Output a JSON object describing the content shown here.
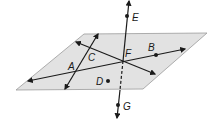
{
  "diagram": {
    "colors": {
      "plane_fill": "#e2e2e2",
      "plane_stroke": "#9a9a9a",
      "line": "#1a1a1a"
    },
    "plane": {
      "points": "84,34 207,33 143,89 16,90"
    },
    "points": [
      {
        "id": "A",
        "label": "A",
        "x": 77,
        "y": 71,
        "lx": 68,
        "ly": 70,
        "dot": false
      },
      {
        "id": "B",
        "label": "B",
        "x": 156,
        "y": 55,
        "lx": 148,
        "ly": 51,
        "dot": true
      },
      {
        "id": "C",
        "label": "C",
        "x": 88,
        "y": 50,
        "lx": 88,
        "ly": 61,
        "dot": false
      },
      {
        "id": "D",
        "label": "D",
        "x": 108,
        "y": 81,
        "lx": 96,
        "ly": 85,
        "dot": true
      },
      {
        "id": "E",
        "label": "E",
        "x": 127,
        "y": 16,
        "lx": 132,
        "ly": 21,
        "dot": true
      },
      {
        "id": "F",
        "label": "F",
        "x": 123,
        "y": 61,
        "lx": 125,
        "ly": 57,
        "dot": false
      },
      {
        "id": "G",
        "label": "G",
        "x": 118,
        "y": 105,
        "lx": 123,
        "ly": 110,
        "dot": true
      }
    ],
    "lines": [
      {
        "id": "line-AB",
        "x1": 28,
        "y1": 81,
        "x2": 185,
        "y2": 49
      },
      {
        "id": "line-through-A-C",
        "x1": 98,
        "y1": 34,
        "x2": 65,
        "y2": 89
      },
      {
        "id": "line-CF",
        "x1": 76,
        "y1": 42,
        "x2": 155,
        "y2": 74
      },
      {
        "id": "line-EF",
        "x1": 129,
        "y1": 1,
        "x2": 123,
        "y2": 61
      },
      {
        "id": "line-FG-dashed",
        "x1": 123,
        "y1": 61,
        "x2": 120,
        "y2": 90
      },
      {
        "id": "line-G",
        "x1": 120,
        "y1": 90,
        "x2": 117,
        "y2": 118
      }
    ]
  }
}
